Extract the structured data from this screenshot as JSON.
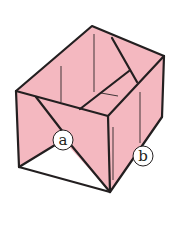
{
  "diagram": {
    "colors": {
      "paper_pink": "#f4b8c0",
      "paper_white": "#ffffff",
      "outline": "#231f20",
      "background": "#ffffff"
    },
    "labels": [
      {
        "id": "a",
        "text": "a"
      },
      {
        "id": "b",
        "text": "b"
      }
    ]
  }
}
